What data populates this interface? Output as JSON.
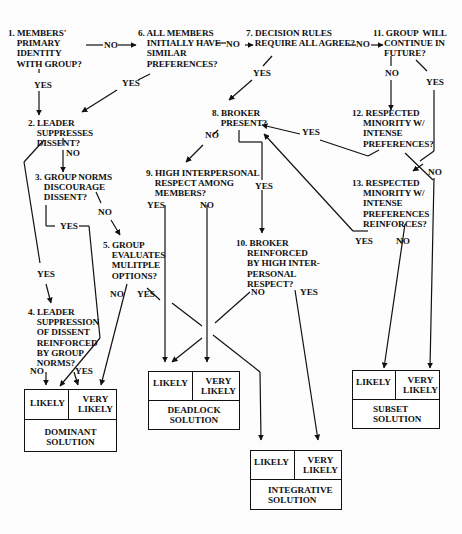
{
  "nodes": {
    "n1": "1. MEMBERS'\n    PRIMARY\n    IDENTITY\n    WITH GROUP?",
    "n2": "2. LEADER\n    SUPPRESSES\n    DISSENT?",
    "n3": "3. GROUP NORMS\n    DISCOURAGE\n    DISSENT?",
    "n4": "4. LEADER\n    SUPPRESSION\n    OF DISSENT\n    REINFORCED\n    BY GROUP\n    NORMS?",
    "n5": "5. GROUP\n    EVALUATES\n    MULITPLE\n    OPTIONS?",
    "n6": "6. ALL MEMBERS\n    INITIALLY HAVE\n    SIMILAR\n    PREFERENCES?",
    "n7": "7. DECISION RULES\n    REQUIRE ALL AGREE?",
    "n8": "8. BROKER\n    PRESENT?",
    "n9": "9. HIGH INTERPERSONAL\n    RESPECT AMONG\n    MEMBERS?",
    "n10": "10. BROKER\n     REINFORCED\n     BY HIGH INTER-\n     PERSONAL\n     RESPECT?",
    "n11": "11. GROUP  WILL\n     CONTINUE IN\n     FUTURE?",
    "n12": "12. RESPECTED\n     MINORITY W/\n     INTENSE\n     PREFERENCES?",
    "n13": "13. RESPECTED\n     MINORITY W/\n     INTENSE\n     PREFERENCES\n     REINFORCES?"
  },
  "edge_labels": {
    "yes": "YES",
    "no": "NO"
  },
  "outcomes": {
    "dominant": {
      "likely": "LIKELY",
      "very_likely": "VERY\nLIKELY",
      "name": "DOMINANT\nSOLUTION"
    },
    "deadlock": {
      "likely": "LIKELY",
      "very_likely": "VERY\nLIKELY",
      "name": "DEADLOCK\nSOLUTION"
    },
    "integrative": {
      "likely": "LIKELY",
      "very_likely": "VERY\nLIKELY",
      "name": "INTEGRATIVE\nSOLUTION"
    },
    "subset": {
      "likely": "LIKELY",
      "very_likely": "VERY\nLIKELY",
      "name": "SUBSET\nSOLUTION"
    }
  },
  "colors": {
    "ink": "#111111",
    "paper": "#fdfdfd"
  }
}
